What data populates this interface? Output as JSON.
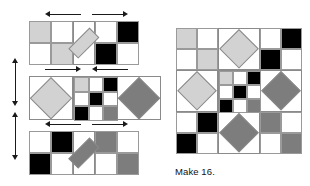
{
  "palette": {
    "white": "#ffffff",
    "light_gray": "#d2d2d2",
    "medium_gray": "#7d7d7d",
    "black": "#000000",
    "grid_line": "#8a8a8a",
    "arrow": "#1a1a1a",
    "background": "#ffffff"
  },
  "caption": {
    "make_label": "Make 16."
  },
  "diagram": {
    "title": "",
    "unit_px": 22,
    "rows": [
      {
        "name": "row-1",
        "columns": 5,
        "height_units": 2,
        "cells": [
          {
            "col": 0,
            "row": 0,
            "fill": "light_gray"
          },
          {
            "col": 1,
            "row": 0,
            "fill": "white"
          },
          {
            "col": 0,
            "row": 1,
            "fill": "white"
          },
          {
            "col": 1,
            "row": 1,
            "fill": "light_gray"
          },
          {
            "col": 3,
            "row": 0,
            "fill": "white"
          },
          {
            "col": 4,
            "row": 0,
            "fill": "black"
          },
          {
            "col": 3,
            "row": 1,
            "fill": "black"
          },
          {
            "col": 4,
            "row": 1,
            "fill": "white"
          }
        ],
        "diamonds": [
          {
            "col": 2,
            "row": 0,
            "span": 1,
            "fill": "light_gray",
            "bg": "white"
          }
        ],
        "arrows": [
          {
            "direction": "left"
          },
          {
            "direction": "right"
          }
        ]
      },
      {
        "name": "row-2",
        "columns": 5,
        "height_units": 2,
        "cells": [],
        "diamonds": [
          {
            "col": 0,
            "row": 0,
            "span": 2,
            "fill": "light_gray",
            "bg": "white"
          },
          {
            "col": 4,
            "row": 0,
            "span": 2,
            "fill": "medium_gray",
            "bg": "white"
          }
        ],
        "checkerboard": {
          "col": 2,
          "row": 0,
          "cols": 3,
          "rows": 3,
          "fills": [
            [
              "light_gray",
              "white",
              "black"
            ],
            [
              "white",
              "black",
              "white"
            ],
            [
              "black",
              "white",
              "medium_gray"
            ]
          ]
        },
        "arrows": [
          {
            "direction": "right"
          },
          {
            "direction": "left"
          }
        ]
      },
      {
        "name": "row-3",
        "columns": 5,
        "height_units": 2,
        "cells": [
          {
            "col": 0,
            "row": 0,
            "fill": "white"
          },
          {
            "col": 1,
            "row": 0,
            "fill": "black"
          },
          {
            "col": 0,
            "row": 1,
            "fill": "black"
          },
          {
            "col": 1,
            "row": 1,
            "fill": "white"
          },
          {
            "col": 3,
            "row": 0,
            "fill": "medium_gray"
          },
          {
            "col": 4,
            "row": 0,
            "fill": "white"
          },
          {
            "col": 3,
            "row": 1,
            "fill": "white"
          },
          {
            "col": 4,
            "row": 1,
            "fill": "medium_gray"
          }
        ],
        "diamonds": [
          {
            "col": 2,
            "row": 0,
            "span": 1,
            "fill": "medium_gray",
            "bg": "white"
          }
        ],
        "arrows": [
          {
            "direction": "left"
          },
          {
            "direction": "right"
          }
        ]
      }
    ],
    "vertical_arrows": [
      {
        "name": "join-arrow-top",
        "direction": "both"
      },
      {
        "name": "join-arrow-bottom",
        "direction": "both"
      }
    ]
  },
  "finished_block": {
    "name": "assembled-block",
    "grid": 6,
    "cells": [
      {
        "col": 0,
        "row": 0,
        "fill": "light_gray"
      },
      {
        "col": 1,
        "row": 0,
        "fill": "white"
      },
      {
        "col": 4,
        "row": 0,
        "fill": "white"
      },
      {
        "col": 5,
        "row": 0,
        "fill": "black"
      },
      {
        "col": 0,
        "row": 1,
        "fill": "white"
      },
      {
        "col": 1,
        "row": 1,
        "fill": "light_gray"
      },
      {
        "col": 4,
        "row": 1,
        "fill": "black"
      },
      {
        "col": 5,
        "row": 1,
        "fill": "white"
      },
      {
        "col": 0,
        "row": 4,
        "fill": "white"
      },
      {
        "col": 1,
        "row": 4,
        "fill": "black"
      },
      {
        "col": 4,
        "row": 4,
        "fill": "medium_gray"
      },
      {
        "col": 5,
        "row": 4,
        "fill": "white"
      },
      {
        "col": 0,
        "row": 5,
        "fill": "black"
      },
      {
        "col": 1,
        "row": 5,
        "fill": "white"
      },
      {
        "col": 4,
        "row": 5,
        "fill": "white"
      },
      {
        "col": 5,
        "row": 5,
        "fill": "medium_gray"
      }
    ],
    "diamonds": [
      {
        "col": 2,
        "row": 0,
        "span": 2,
        "fill": "light_gray"
      },
      {
        "col": 0,
        "row": 2,
        "span": 2,
        "fill": "light_gray"
      },
      {
        "col": 4,
        "row": 2,
        "span": 2,
        "fill": "medium_gray"
      },
      {
        "col": 2,
        "row": 4,
        "span": 2,
        "fill": "medium_gray"
      }
    ],
    "checkerboard": {
      "col": 2,
      "row": 2,
      "cols": 3,
      "rows": 3,
      "fills": [
        [
          "light_gray",
          "white",
          "black"
        ],
        [
          "white",
          "black",
          "white"
        ],
        [
          "black",
          "white",
          "medium_gray"
        ]
      ]
    }
  }
}
